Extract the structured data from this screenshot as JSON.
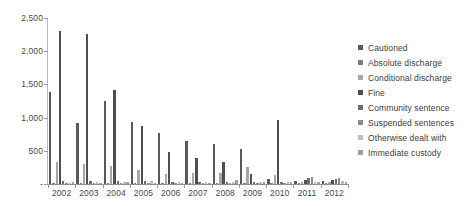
{
  "chart_data": {
    "type": "bar",
    "title": "",
    "xlabel": "",
    "ylabel": "",
    "ylim": [
      0,
      2500
    ],
    "ytick_labels": [
      "2,500",
      "2,000",
      "1,500",
      "1,000",
      "500",
      "-"
    ],
    "ytick_values": [
      2500,
      2000,
      1500,
      1000,
      500,
      0
    ],
    "grid": false,
    "legend_position": "right",
    "categories": [
      "2002",
      "2003",
      "2004",
      "2005",
      "2006",
      "2007",
      "2008",
      "2009",
      "2010",
      "2011",
      "2012"
    ],
    "series": [
      {
        "name": "Cautioned",
        "color": "#595959",
        "values": [
          1380,
          920,
          1250,
          940,
          770,
          650,
          610,
          520,
          80,
          40,
          45
        ]
      },
      {
        "name": "Absolute discharge",
        "color": "#7f7f7f",
        "values": [
          20,
          15,
          20,
          15,
          10,
          10,
          10,
          10,
          5,
          5,
          5
        ]
      },
      {
        "name": "Conditional discharge",
        "color": "#a6a6a6",
        "values": [
          330,
          300,
          270,
          215,
          150,
          160,
          160,
          250,
          135,
          35,
          30
        ]
      },
      {
        "name": "Fine",
        "color": "#4f4f4f",
        "values": [
          2300,
          2260,
          1420,
          880,
          480,
          390,
          330,
          155,
          960,
          60,
          55
        ]
      },
      {
        "name": "Community sentence",
        "color": "#6e6e6e",
        "values": [
          40,
          45,
          50,
          40,
          35,
          30,
          30,
          30,
          35,
          85,
          75
        ]
      },
      {
        "name": "Suspended sentences",
        "color": "#8c8c8c",
        "values": [
          10,
          15,
          20,
          15,
          15,
          15,
          15,
          15,
          20,
          110,
          95
        ]
      },
      {
        "name": "Otherwise dealt with",
        "color": "#bfbfbf",
        "values": [
          15,
          25,
          30,
          45,
          30,
          25,
          25,
          25,
          30,
          35,
          50
        ]
      },
      {
        "name": "Immediate custody",
        "color": "#a0a0a0",
        "values": [
          25,
          20,
          25,
          20,
          20,
          20,
          55,
          35,
          30,
          30,
          35
        ]
      }
    ]
  }
}
